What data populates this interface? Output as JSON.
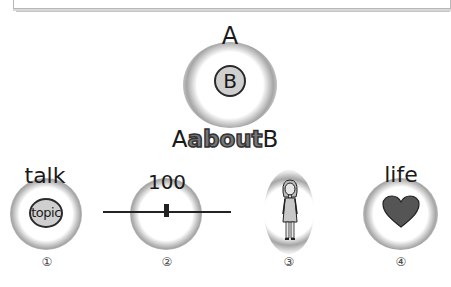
{
  "header": {
    "frame": "box-bottom-edge"
  },
  "main_concept": {
    "top_label": "A",
    "circle_label": "B",
    "phrase": {
      "prefix": "A",
      "emphasis": "about",
      "suffix": "B"
    }
  },
  "items": [
    {
      "number": "①",
      "label": "talk",
      "icon": "topic-circle-icon",
      "icon_text": "topic"
    },
    {
      "number": "②",
      "label": "100",
      "icon": "slider-icon",
      "slider_value": "middle"
    },
    {
      "number": "③",
      "label": "",
      "icon": "woman-figure-icon"
    },
    {
      "number": "④",
      "label": "life",
      "icon": "heart-icon"
    }
  ],
  "colors": {
    "glow": "#999999",
    "fill": "#cfcfcf",
    "stroke": "#2a2a2a",
    "heart": "#555555"
  }
}
